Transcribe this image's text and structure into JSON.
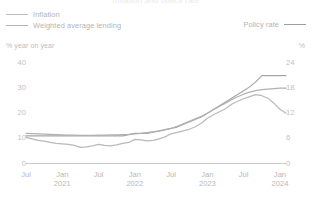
{
  "title_cut": "Inflation and policy rate",
  "legend": {
    "left_items": [
      {
        "label": "Inflation",
        "color": "#b9b9b9",
        "name": "inflation"
      },
      {
        "label": "Weighted average lending",
        "color": "#b4b4b4",
        "name": "weighted-average-lending"
      }
    ],
    "right_item": {
      "label": "Policy rate",
      "color": "#9e9e9e",
      "name": "policy-rate"
    }
  },
  "axis_units": {
    "left": "% year on year",
    "right": "%"
  },
  "chart_data": {
    "type": "line",
    "title": "Inflation and policy rate",
    "xlabel": "",
    "ylabel": "% year on year",
    "ylabel_right": "%",
    "grid": false,
    "legend_position": "top",
    "xlim": [
      0,
      43
    ],
    "ylim": [
      0,
      40
    ],
    "ylim_right": [
      0,
      24
    ],
    "yticks_left": [
      0,
      10,
      20,
      30,
      40
    ],
    "yticks_right": [
      0,
      6,
      12,
      18,
      24
    ],
    "xticks": [
      {
        "pos": 0,
        "label": "Jul",
        "year": ""
      },
      {
        "pos": 6,
        "label": "Jan",
        "year": "2021"
      },
      {
        "pos": 12,
        "label": "Jul",
        "year": ""
      },
      {
        "pos": 18,
        "label": "Jan",
        "year": "2022"
      },
      {
        "pos": 24,
        "label": "Jul",
        "year": ""
      },
      {
        "pos": 30,
        "label": "Jan",
        "year": "2023"
      },
      {
        "pos": 36,
        "label": "Jul",
        "year": ""
      },
      {
        "pos": 42,
        "label": "Jan",
        "year": "2024"
      }
    ],
    "x": [
      0,
      1,
      2,
      3,
      4,
      5,
      6,
      7,
      8,
      9,
      10,
      11,
      12,
      13,
      14,
      15,
      16,
      17,
      18,
      19,
      20,
      21,
      22,
      23,
      24,
      25,
      26,
      27,
      28,
      29,
      30,
      31,
      32,
      33,
      34,
      35,
      36,
      37,
      38,
      39,
      40,
      41,
      42,
      43
    ],
    "series": [
      {
        "name": "Inflation",
        "axis": "left",
        "color": "#b9b9b9",
        "values": [
          10.4,
          9.8,
          9.2,
          8.9,
          8.4,
          8.0,
          7.8,
          7.6,
          7.2,
          6.4,
          6.6,
          7.0,
          7.6,
          7.2,
          7.0,
          7.4,
          8.0,
          8.4,
          9.6,
          9.4,
          9.0,
          9.2,
          9.8,
          10.6,
          11.8,
          12.4,
          13.0,
          13.6,
          14.6,
          16.0,
          18.0,
          19.4,
          20.6,
          21.8,
          23.6,
          24.8,
          25.8,
          26.6,
          27.4,
          27.0,
          26.0,
          24.0,
          21.6,
          20.0
        ]
      },
      {
        "name": "Weighted average lending",
        "axis": "left",
        "color": "#b0b0b0",
        "values": [
          12.0,
          11.9,
          11.8,
          11.7,
          11.6,
          11.5,
          11.4,
          11.3,
          11.3,
          11.2,
          11.2,
          11.2,
          11.3,
          11.3,
          11.4,
          11.4,
          11.5,
          11.6,
          11.8,
          12.0,
          12.3,
          12.6,
          12.9,
          13.4,
          14.0,
          14.8,
          15.8,
          16.8,
          17.8,
          18.8,
          20.0,
          21.4,
          22.8,
          24.0,
          25.4,
          26.6,
          27.6,
          28.4,
          29.0,
          29.4,
          29.6,
          29.8,
          30.0,
          30.0
        ]
      },
      {
        "name": "Policy rate",
        "axis": "right",
        "color": "#a6a6a6",
        "values": [
          6.6,
          6.6,
          6.6,
          6.6,
          6.6,
          6.6,
          6.6,
          6.6,
          6.6,
          6.6,
          6.6,
          6.6,
          6.6,
          6.6,
          6.6,
          6.6,
          6.6,
          6.9,
          7.2,
          7.2,
          7.2,
          7.5,
          7.8,
          8.1,
          8.4,
          8.7,
          9.3,
          9.9,
          10.5,
          11.1,
          12.0,
          12.9,
          13.8,
          14.7,
          15.6,
          16.5,
          17.4,
          18.3,
          19.5,
          21.0,
          21.0,
          21.0,
          21.0,
          21.0
        ]
      }
    ]
  }
}
